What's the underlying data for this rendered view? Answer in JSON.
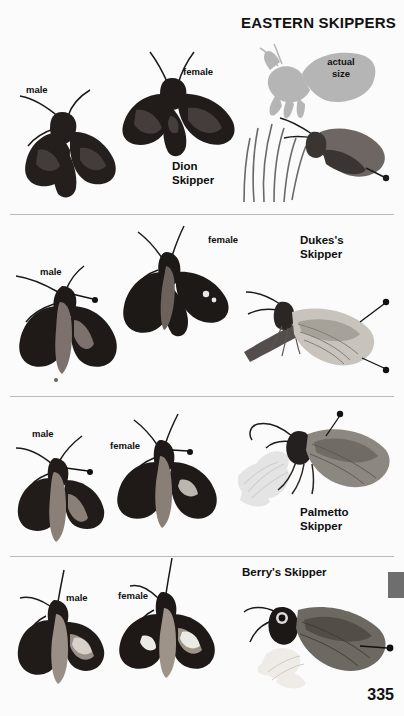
{
  "page": {
    "title": "EASTERN SKIPPERS",
    "number": "335",
    "background_color": "#fbfbfb",
    "divider_color": "#b9b9b9",
    "edge_tab_color": "#6e6e6e"
  },
  "actual_size": {
    "label": "actual\nsize",
    "silhouette_color": "#b5b5b5"
  },
  "sections": [
    {
      "species": "Dion\nSkipper",
      "specimens": [
        {
          "sex": "male",
          "view": "dorsal-spread"
        },
        {
          "sex": "female",
          "view": "dorsal-spread"
        },
        {
          "sex": "",
          "view": "lateral-perched-on-grass"
        }
      ]
    },
    {
      "species": "Dukes's\nSkipper",
      "specimens": [
        {
          "sex": "male",
          "view": "dorsal-spread"
        },
        {
          "sex": "female",
          "view": "dorsal-spread"
        },
        {
          "sex": "",
          "view": "lateral-perched-on-stem"
        }
      ]
    },
    {
      "species": "Palmetto\nSkipper",
      "specimens": [
        {
          "sex": "male",
          "view": "dorsal-spread"
        },
        {
          "sex": "female",
          "view": "dorsal-spread"
        },
        {
          "sex": "",
          "view": "lateral-perched-on-flower"
        }
      ]
    },
    {
      "species": "Berry's Skipper",
      "specimens": [
        {
          "sex": "male",
          "view": "dorsal-spread"
        },
        {
          "sex": "female",
          "view": "dorsal-spread"
        },
        {
          "sex": "",
          "view": "lateral-perched-on-flower"
        }
      ]
    }
  ]
}
